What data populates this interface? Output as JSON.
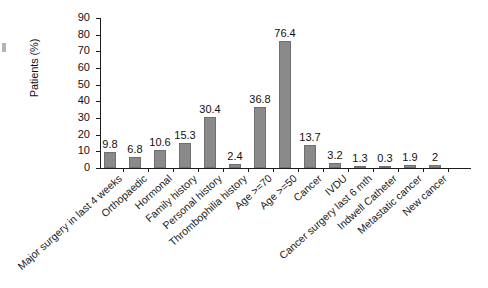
{
  "chart_data": {
    "type": "bar",
    "title": "",
    "xlabel": "",
    "ylabel": "Patients (%)",
    "ylim": [
      0,
      90
    ],
    "yticks": [
      0,
      10,
      20,
      30,
      40,
      50,
      60,
      70,
      80,
      90
    ],
    "grid": false,
    "legend": null,
    "bar_color": "#8a8a8a",
    "categories": [
      "Major surgery in last 4 weeks",
      "Orthopaedic",
      "Hormonal",
      "Family history",
      "Personal history",
      "Thrombophilia history",
      "Age >=70",
      "Age >=50",
      "Cancer",
      "IVDU",
      "Cancer surgery last 6 mth",
      "Indwell Catheter",
      "Metastatic cancer",
      "New cancer"
    ],
    "values": [
      9.8,
      6.8,
      10.6,
      15.3,
      30.4,
      2.4,
      36.8,
      76.4,
      13.7,
      3.2,
      1.3,
      0.3,
      1.9,
      2
    ],
    "value_labels": [
      "9.8",
      "6.8",
      "10.6",
      "15.3",
      "30.4",
      "2.4",
      "36.8",
      "76.4",
      "13.7",
      "3.2",
      "1.3",
      "0.3",
      "1.9",
      "2"
    ]
  }
}
